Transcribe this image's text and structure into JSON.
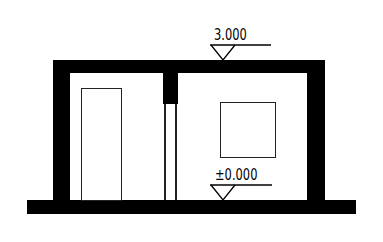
{
  "drawing": {
    "type": "architectural-section",
    "elevations": [
      {
        "id": "roof",
        "label": "3.000"
      },
      {
        "id": "floor",
        "label": "±0.000"
      }
    ],
    "colors": {
      "wall": "#000000",
      "line": "#222222",
      "background": "#ffffff"
    }
  }
}
